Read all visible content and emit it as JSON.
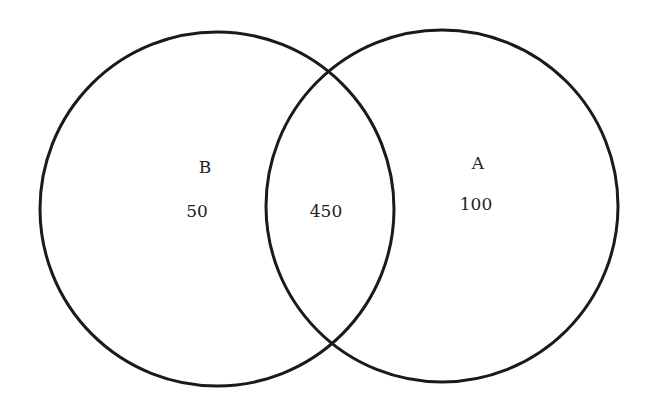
{
  "diagram": {
    "type": "venn",
    "stroke_color": "#1a1a1a",
    "sets": [
      {
        "name": "B",
        "label": "B",
        "only_value": "50"
      },
      {
        "name": "A",
        "label": "A",
        "only_value": "100"
      }
    ],
    "intersection": {
      "value": "450"
    }
  }
}
